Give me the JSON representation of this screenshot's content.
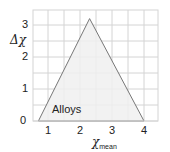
{
  "chart_data": {
    "type": "area",
    "title": "",
    "xlabel": "χ_mean",
    "ylabel": "Δχ",
    "xlim": [
      0.53,
      4.44
    ],
    "ylim": [
      0,
      3.47
    ],
    "x_ticks": [
      1,
      2,
      3,
      4
    ],
    "y_ticks": [
      0,
      1,
      2,
      3
    ],
    "grid": true,
    "grid_step": 0.5,
    "legend": null,
    "series": [
      {
        "name": "Bond-type triangle",
        "shape": "triangle",
        "points": [
          [
            0.7,
            0
          ],
          [
            2.3,
            3.2
          ],
          [
            4.0,
            0
          ]
        ],
        "fill": "#f0f0f0",
        "stroke": "#777777"
      }
    ],
    "annotations": [
      {
        "text": "Alloys",
        "x": 1.0,
        "y": 0.35
      }
    ]
  },
  "labels": {
    "y_axis": "Δχ",
    "x_axis_main": "χ",
    "x_axis_sub": "mean",
    "region": "Alloys",
    "x_ticks": [
      "1",
      "2",
      "3",
      "4"
    ],
    "y_ticks": [
      "0",
      "1",
      "2",
      "3"
    ]
  },
  "colors": {
    "grid": "#d4d4d4",
    "fill": "#f0f0f0",
    "stroke": "#777777",
    "text": "#222222"
  }
}
